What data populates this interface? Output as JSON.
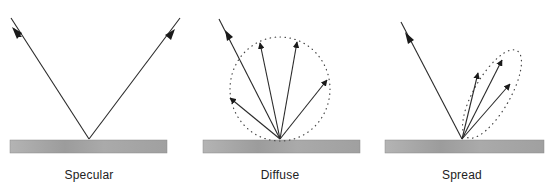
{
  "panels": [
    {
      "id": "specular",
      "label": "Specular"
    },
    {
      "id": "diffuse",
      "label": "Diffuse"
    },
    {
      "id": "spread",
      "label": "Spread"
    }
  ],
  "colors": {
    "line": "#2a2a2a",
    "surface": "#a8a8a8",
    "dots": "#444444"
  }
}
